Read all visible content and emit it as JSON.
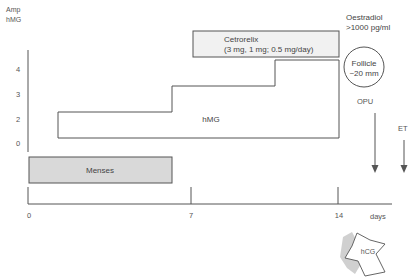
{
  "diagram": {
    "y_axis": {
      "title_line1": "Amp",
      "title_line2": "hMG",
      "ticks": [
        "4",
        "3",
        "2",
        "0"
      ]
    },
    "x_axis": {
      "ticks": [
        "0",
        "7",
        "14"
      ],
      "unit_label": "days"
    },
    "hmg_block": {
      "label": "hMG",
      "steps_amp": [
        2,
        3,
        4
      ],
      "start_day": 1.3,
      "end_day": 14
    },
    "cetrorelix_block": {
      "title": "Cetrorelix",
      "dose": "(3 mg, 1 mg; 0.5 mg/day)",
      "start_day": 7,
      "end_day": 14
    },
    "menses_block": {
      "label": "Menses",
      "start_day": 0,
      "end_day": 6.5
    },
    "oestradiol": {
      "line1": "Oestradiol",
      "line2": ">1000 pg/ml"
    },
    "follicle": {
      "line1": "Follicle",
      "line2": "~20 mm"
    },
    "events": {
      "opu_label": "OPU",
      "et_label": "ET",
      "hcg_label": "hCG"
    },
    "colors": {
      "line": "#555555",
      "menses_fill": "#d9d9d9",
      "cetrorelix_fill": "#f1f1f1",
      "hcg_shadow": "#c8c8c8"
    }
  }
}
